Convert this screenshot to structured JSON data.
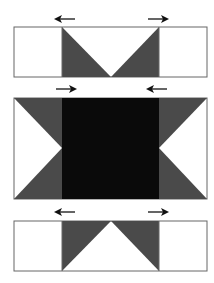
{
  "diagram": {
    "colors": {
      "background": "#ffffff",
      "outline": "#555555",
      "medium": "#4a4a4a",
      "dark": "#0a0a0a",
      "arrow": "#111111"
    },
    "rows": [
      {
        "name": "top-row",
        "arrows": [
          "left",
          "right"
        ],
        "pattern": "flying-geese-down"
      },
      {
        "name": "middle-row",
        "arrows": [
          "right",
          "left"
        ],
        "pattern": "center-square-with-side-triangles"
      },
      {
        "name": "bottom-row",
        "arrows": [
          "left",
          "right"
        ],
        "pattern": "flying-geese-up"
      }
    ]
  }
}
